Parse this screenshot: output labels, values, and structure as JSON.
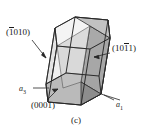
{
  "figure": {
    "caption": "(c)",
    "type": "hexagonal-crystal-prism-miller-bravais-planes",
    "background_color": "#ffffff",
    "line_color": "#1a1a1a",
    "labels": {
      "plane_prism": {
        "prefix": "(",
        "bar_char": "1",
        "rest": "010",
        "suffix": ")",
        "full": "(1̅0 1 0)"
      },
      "plane_pyramid": {
        "prefix": "(10",
        "bar_char": "1",
        "rest": "1",
        "suffix": ")",
        "full": "(101̅1)"
      },
      "basal_plane": "(0001)",
      "axis_a3": {
        "name": "a",
        "sub": "3"
      },
      "axis_a1": {
        "name": "a",
        "sub": "1"
      }
    }
  },
  "geometry": {
    "shading": {
      "basal_face_fill": "#b5b5b5",
      "pyramid_face_fill": "#a9a9a9",
      "prism_face_fill": "#c9c9c9",
      "dark_face_fill": "#8e8e8e",
      "light_face_fill": "#d8d8d8"
    },
    "top_hex": [
      [
        55,
        28
      ],
      [
        75,
        17
      ],
      [
        108,
        20
      ],
      [
        110,
        38
      ],
      [
        90,
        49
      ],
      [
        57,
        46
      ]
    ],
    "bottom_hex": [
      [
        46,
        84
      ],
      [
        66,
        73
      ],
      [
        99,
        76
      ],
      [
        101,
        94
      ],
      [
        81,
        105
      ],
      [
        48,
        102
      ]
    ]
  }
}
